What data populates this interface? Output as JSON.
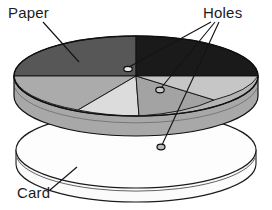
{
  "figure": {
    "background_color": "#ffffff",
    "width": 272,
    "height": 210
  },
  "labels": {
    "paper": "Paper",
    "holes": "Holes",
    "card": "Card"
  },
  "colors": {
    "outline": "#101010",
    "paper_segment_darkgray": "#575757",
    "paper_segment_black": "#1a1a1a",
    "paper_segment_midgray": "#ababab",
    "paper_segment_lightgray": "#dcdcdc",
    "paper_segment_palegray": "#c6c6c6",
    "paper_rim": "#9a9a9a",
    "card_top": "#fdfdfd",
    "card_rim": "#f2f2f2",
    "label_text": "#1b1b1b"
  },
  "parts": {
    "paper_disc": "paper-disc",
    "card_disc": "card-disc",
    "holes": [
      "hole-upper-left",
      "hole-center-right",
      "hole-lower"
    ]
  },
  "paper_segments": [
    {
      "name": "segment-upper-left-dark",
      "shade": "#575757"
    },
    {
      "name": "segment-upper-right-black",
      "shade": "#1a1a1a"
    },
    {
      "name": "segment-left-mid",
      "shade": "#ababab"
    },
    {
      "name": "segment-bottom-light",
      "shade": "#dcdcdc"
    },
    {
      "name": "segment-lower-right",
      "shade": "#a3a3a3"
    },
    {
      "name": "segment-right-pale",
      "shade": "#c6c6c6"
    }
  ],
  "leader_lines": [
    {
      "name": "leader-paper",
      "from": "paper-label",
      "to": "paper-surface"
    },
    {
      "name": "leader-holes-1",
      "from": "holes-label",
      "to": "hole-upper-left"
    },
    {
      "name": "leader-holes-2",
      "from": "holes-label",
      "to": "hole-center-right"
    },
    {
      "name": "leader-holes-3",
      "from": "holes-label",
      "to": "hole-lower"
    },
    {
      "name": "leader-card",
      "from": "card-label",
      "to": "card-edge"
    }
  ]
}
